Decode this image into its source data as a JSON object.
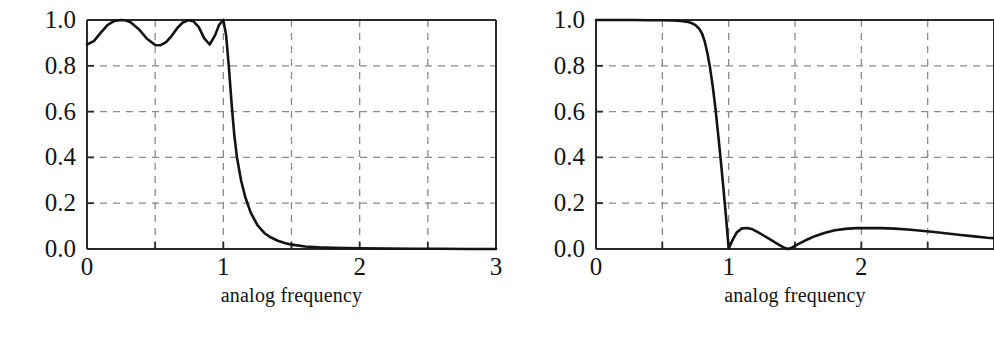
{
  "figure": {
    "background": "#ffffff",
    "ink_color": "#131313",
    "grid_color": "#8a8a8a",
    "axis_color": "#2a2a2a",
    "panel_count": 2
  },
  "panels": [
    {
      "name": "left-panel",
      "xlabel": "analog frequency",
      "frame": {
        "x": 87,
        "y": 20,
        "width": 409,
        "height": 229
      },
      "xtick_labels": [
        "0",
        "1",
        "2",
        "3"
      ],
      "ytick_labels": [
        "0.0",
        "0.2",
        "0.4",
        "0.6",
        "0.8",
        "1.0"
      ]
    },
    {
      "name": "right-panel",
      "xlabel": "analog frequency",
      "frame": {
        "x": 596,
        "y": 20,
        "width": 398,
        "height": 229
      },
      "xtick_labels": [
        "0",
        "1",
        "2"
      ],
      "ytick_labels": [
        "0.0",
        "0.2",
        "0.4",
        "0.6",
        "0.8",
        "1.0"
      ]
    }
  ],
  "chart_data": [
    {
      "type": "line",
      "title": "",
      "panel": "left-panel",
      "xlabel": "analog frequency",
      "ylabel": "",
      "xlim": [
        0,
        3
      ],
      "ylim": [
        0,
        1
      ],
      "xticks": [
        0,
        0.5,
        1,
        1.5,
        2,
        2.5,
        3
      ],
      "xtick_labels": [
        "0",
        "",
        "1",
        "",
        "2",
        "",
        "3"
      ],
      "yticks": [
        0.0,
        0.2,
        0.4,
        0.6,
        0.8,
        1.0
      ],
      "ytick_labels": [
        "0.0",
        "0.2",
        "0.4",
        "0.6",
        "0.8",
        "1.0"
      ],
      "grid": true,
      "grid_style": "dashed",
      "legend": "none",
      "series": [
        {
          "name": "magnitude response (equiripple passband)",
          "color": "#131313",
          "linewidth": 2.6,
          "x": [
            0.0,
            0.05,
            0.1,
            0.15,
            0.2,
            0.25,
            0.28,
            0.32,
            0.38,
            0.44,
            0.5,
            0.54,
            0.58,
            0.62,
            0.66,
            0.7,
            0.74,
            0.78,
            0.82,
            0.86,
            0.9,
            0.94,
            0.97,
            1.0,
            1.02,
            1.04,
            1.06,
            1.08,
            1.1,
            1.13,
            1.16,
            1.2,
            1.25,
            1.3,
            1.35,
            1.4,
            1.45,
            1.5,
            1.6,
            1.7,
            1.8,
            1.9,
            2.0,
            2.2,
            2.4,
            2.6,
            2.8,
            3.0
          ],
          "y": [
            0.893,
            0.908,
            0.944,
            0.978,
            0.996,
            1.0,
            0.999,
            0.99,
            0.96,
            0.918,
            0.891,
            0.89,
            0.903,
            0.93,
            0.963,
            0.988,
            0.999,
            0.995,
            0.969,
            0.92,
            0.893,
            0.934,
            0.98,
            1.0,
            0.935,
            0.8,
            0.64,
            0.5,
            0.4,
            0.3,
            0.228,
            0.16,
            0.104,
            0.07,
            0.05,
            0.036,
            0.026,
            0.019,
            0.011,
            0.007,
            0.005,
            0.004,
            0.003,
            0.002,
            0.001,
            0.001,
            0.0,
            0.0
          ]
        }
      ]
    },
    {
      "type": "line",
      "title": "",
      "panel": "right-panel",
      "xlabel": "analog frequency",
      "ylabel": "",
      "xlim": [
        0,
        3.0
      ],
      "ylim": [
        0,
        1
      ],
      "xticks": [
        0,
        0.5,
        1,
        1.5,
        2,
        2.5,
        3
      ],
      "xtick_labels": [
        "0",
        "",
        "1",
        "",
        "2",
        "",
        ""
      ],
      "yticks": [
        0.0,
        0.2,
        0.4,
        0.6,
        0.8,
        1.0
      ],
      "ytick_labels": [
        "0.0",
        "0.2",
        "0.4",
        "0.6",
        "0.8",
        "1.0"
      ],
      "grid": true,
      "grid_style": "dashed",
      "legend": "none",
      "series": [
        {
          "name": "magnitude response (flat passband, equiripple stopband)",
          "color": "#131313",
          "linewidth": 2.6,
          "x": [
            0.0,
            0.1,
            0.2,
            0.3,
            0.4,
            0.5,
            0.58,
            0.64,
            0.68,
            0.72,
            0.75,
            0.78,
            0.8,
            0.82,
            0.84,
            0.86,
            0.88,
            0.9,
            0.92,
            0.94,
            0.96,
            0.98,
            1.0,
            1.03,
            1.06,
            1.1,
            1.14,
            1.18,
            1.22,
            1.26,
            1.3,
            1.34,
            1.38,
            1.42,
            1.45,
            1.48,
            1.52,
            1.58,
            1.65,
            1.72,
            1.8,
            1.88,
            1.96,
            2.05,
            2.15,
            2.25,
            2.35,
            2.45,
            2.55,
            2.65,
            2.75,
            2.85,
            2.95,
            3.0
          ],
          "y": [
            1.0,
            1.0,
            1.0,
            1.0,
            0.999,
            0.999,
            0.998,
            0.996,
            0.993,
            0.987,
            0.978,
            0.96,
            0.94,
            0.905,
            0.855,
            0.79,
            0.71,
            0.615,
            0.505,
            0.39,
            0.268,
            0.14,
            0.002,
            0.04,
            0.072,
            0.09,
            0.092,
            0.086,
            0.074,
            0.06,
            0.046,
            0.032,
            0.018,
            0.005,
            0.0,
            0.007,
            0.02,
            0.038,
            0.056,
            0.07,
            0.082,
            0.088,
            0.091,
            0.092,
            0.091,
            0.089,
            0.085,
            0.08,
            0.074,
            0.068,
            0.061,
            0.055,
            0.049,
            0.047
          ]
        }
      ]
    }
  ]
}
